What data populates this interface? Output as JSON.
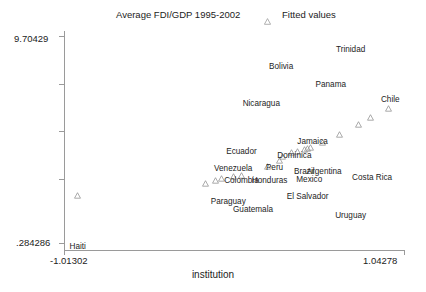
{
  "legend": {
    "series_label": "Average FDI/GDP 1995-2002",
    "fitted_label": "Fitted values",
    "fitted_marker_icon": "triangle-marker"
  },
  "axes": {
    "y_max_label": "9.70429",
    "y_min_label": ".284286",
    "x_min_label": "-1.01302",
    "x_max_label": "1.04278",
    "x_title": "institution",
    "y_title": ""
  },
  "chart_data": {
    "type": "scatter",
    "title": "Average FDI/GDP 1995-2002",
    "xlabel": "institution",
    "ylabel": "Average FDI/GDP 1995-2002",
    "xlim": [
      -1.01302,
      1.04278
    ],
    "ylim": [
      0.284286,
      9.70429
    ],
    "grid": false,
    "legend_position": "top",
    "series": [
      {
        "name": "Average FDI/GDP 1995-2002",
        "marker": "label-only",
        "points": [
          {
            "label": "Trinidad",
            "x": 0.72,
            "y": 9.1
          },
          {
            "label": "Bolivia",
            "x": 0.3,
            "y": 8.32
          },
          {
            "label": "Panama",
            "x": 0.6,
            "y": 7.55
          },
          {
            "label": "Chile",
            "x": 0.96,
            "y": 6.9
          },
          {
            "label": "Nicaragua",
            "x": 0.18,
            "y": 6.72
          },
          {
            "label": "Jamaica",
            "x": 0.49,
            "y": 5.02
          },
          {
            "label": "Ecuador",
            "x": 0.06,
            "y": 4.62
          },
          {
            "label": "Dominica",
            "x": 0.38,
            "y": 4.42
          },
          {
            "label": "Venezuela",
            "x": 0.01,
            "y": 3.85
          },
          {
            "label": "Peru",
            "x": 0.26,
            "y": 3.88
          },
          {
            "label": "Brazil",
            "x": 0.44,
            "y": 3.7
          },
          {
            "label": "Argentina",
            "x": 0.56,
            "y": 3.7
          },
          {
            "label": "Mexico",
            "x": 0.47,
            "y": 3.38
          },
          {
            "label": "Costa Rica",
            "x": 0.85,
            "y": 3.45
          },
          {
            "label": "Colombia",
            "x": 0.06,
            "y": 3.3
          },
          {
            "label": "Honduras",
            "x": 0.23,
            "y": 3.32
          },
          {
            "label": "El Salvador",
            "x": 0.46,
            "y": 2.62
          },
          {
            "label": "Paraguay",
            "x": -0.02,
            "y": 2.4
          },
          {
            "label": "Guatemala",
            "x": 0.13,
            "y": 2.05
          },
          {
            "label": "Uruguay",
            "x": 0.72,
            "y": 1.8
          },
          {
            "label": "Haiti",
            "x": -0.93,
            "y": 0.4
          }
        ]
      },
      {
        "name": "Fitted values",
        "marker": "triangle",
        "points": [
          {
            "x": -0.93,
            "y": 2.7
          },
          {
            "x": -0.16,
            "y": 3.22
          },
          {
            "x": -0.1,
            "y": 3.35
          },
          {
            "x": -0.06,
            "y": 3.42
          },
          {
            "x": 0.01,
            "y": 3.52
          },
          {
            "x": 0.06,
            "y": 3.58
          },
          {
            "x": 0.22,
            "y": 3.98
          },
          {
            "x": 0.29,
            "y": 4.22
          },
          {
            "x": 0.31,
            "y": 4.38
          },
          {
            "x": 0.36,
            "y": 4.58
          },
          {
            "x": 0.4,
            "y": 4.62
          },
          {
            "x": 0.44,
            "y": 4.7
          },
          {
            "x": 0.46,
            "y": 4.74
          },
          {
            "x": 0.48,
            "y": 4.78
          },
          {
            "x": 0.55,
            "y": 5.02
          },
          {
            "x": 0.65,
            "y": 5.38
          },
          {
            "x": 0.77,
            "y": 5.82
          },
          {
            "x": 0.84,
            "y": 6.1
          },
          {
            "x": 0.95,
            "y": 6.52
          }
        ]
      }
    ]
  },
  "labels": {
    "trinidad": "Trinidad",
    "bolivia": "Bolivia",
    "panama": "Panama",
    "chile": "Chile",
    "nicaragua": "Nicaragua",
    "jamaica": "Jamaica",
    "ecuador": "Ecuador",
    "dominica": "Dominica",
    "venezuela": "Venezuela",
    "peru": "Peru",
    "brazil": "Brazil",
    "argentina": "Argentina",
    "mexico": "Mexico",
    "costa_rica": "Costa Rica",
    "colombia": "Colombia",
    "honduras": "Honduras",
    "el_salvador": "El Salvador",
    "paraguay": "Paraguay",
    "guatemala": "Guatemala",
    "uruguay": "Uruguay",
    "haiti": "Haiti"
  }
}
